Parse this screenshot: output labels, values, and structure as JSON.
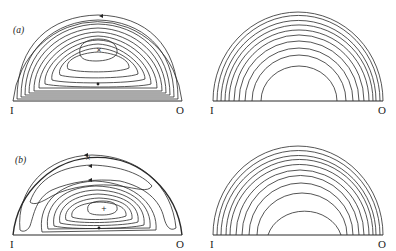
{
  "figure": {
    "panels": [
      {
        "id": "a",
        "label": "(a)",
        "left": {
          "description": "closed streamlines in meridional half-plane",
          "inner_label": "I",
          "outer_label": "O",
          "center_marker": "×",
          "contour_count": 11
        },
        "right": {
          "description": "concentric nested semicircular contours",
          "inner_label": "I",
          "outer_label": "O",
          "contour_count": 10
        }
      },
      {
        "id": "b",
        "label": "(b)",
        "left": {
          "description": "two-cell streamline pattern with outer lobes",
          "inner_label": "I",
          "outer_label": "O",
          "center_marker": "+",
          "secondary_marker": "×",
          "contour_count": 11
        },
        "right": {
          "description": "concentric nested semicircular contours",
          "inner_label": "I",
          "outer_label": "O",
          "contour_count": 10
        }
      }
    ]
  }
}
